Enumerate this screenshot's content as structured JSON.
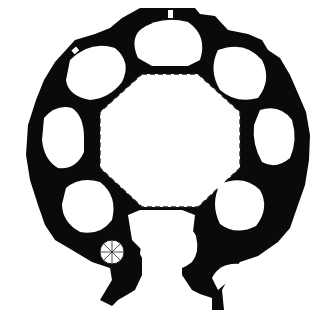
{
  "diagram": {
    "type": "architectural-floor-plan",
    "labels": [],
    "colors": {
      "wall": "#0a0a0a",
      "background": "#ffffff",
      "dashed_line": "#222222"
    },
    "central_space": {
      "shape": "octagon",
      "outline": "dashed"
    },
    "chapels": {
      "count": 7,
      "shape": "quatrefoil/lobed"
    },
    "entrance": {
      "position": "bottom",
      "type": "lobed vestibule"
    },
    "features": [
      "spiral staircase (bottom-left)",
      "curved stair (bottom-right)",
      "window openings in outer wall"
    ]
  }
}
